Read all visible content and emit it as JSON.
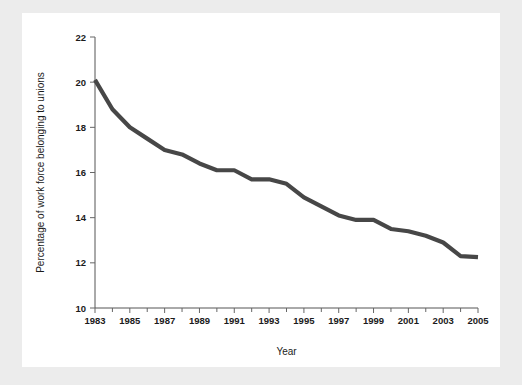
{
  "chart_data": {
    "type": "line",
    "title": "",
    "subtitle": "",
    "xlabel": "Year",
    "ylabel": "Percentage of work force belonging to unions",
    "xlim": [
      1983,
      2005
    ],
    "ylim": [
      10,
      22
    ],
    "grid": false,
    "legend": false,
    "legend_position": "none",
    "line_color": "#474747",
    "x_ticks": [
      1983,
      1985,
      1987,
      1989,
      1991,
      1993,
      1995,
      1997,
      1999,
      2001,
      2003,
      2005
    ],
    "x_tick_labels": [
      "1983",
      "1985",
      "1987",
      "1989",
      "1991",
      "1993",
      "1995",
      "1997",
      "1999",
      "2001",
      "2003",
      "2005"
    ],
    "x_minor_ticks": [
      1984,
      1986,
      1988,
      1990,
      1992,
      1994,
      1996,
      1998,
      2000,
      2002,
      2004
    ],
    "y_ticks": [
      10,
      12,
      14,
      16,
      18,
      20,
      22
    ],
    "y_tick_labels": [
      "10",
      "12",
      "14",
      "16",
      "18",
      "20",
      "22"
    ],
    "x": [
      1983,
      1984,
      1985,
      1986,
      1987,
      1988,
      1989,
      1990,
      1991,
      1992,
      1993,
      1994,
      1995,
      1996,
      1997,
      1998,
      1999,
      2000,
      2001,
      2002,
      2003,
      2004,
      2005
    ],
    "values": [
      20.1,
      18.8,
      18.0,
      17.5,
      17.0,
      16.8,
      16.4,
      16.1,
      16.1,
      15.7,
      15.7,
      15.5,
      14.9,
      14.5,
      14.1,
      13.9,
      13.9,
      13.5,
      13.4,
      13.2,
      12.9,
      12.3,
      12.25
    ],
    "series": [
      {
        "name": "Union membership",
        "values": [
          20.1,
          18.8,
          18.0,
          17.5,
          17.0,
          16.8,
          16.4,
          16.1,
          16.1,
          15.7,
          15.7,
          15.5,
          14.9,
          14.5,
          14.1,
          13.9,
          13.9,
          13.5,
          13.4,
          13.2,
          12.9,
          12.3,
          12.25
        ]
      }
    ],
    "annotations": []
  },
  "figure": {
    "background_color": "#ffffff",
    "page_background_color": "#ececec"
  }
}
